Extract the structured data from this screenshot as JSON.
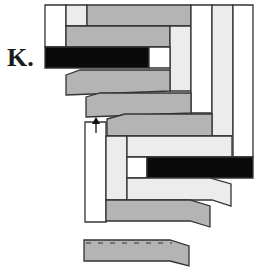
{
  "figure": {
    "label": "K.",
    "colors": {
      "white": "#ffffff",
      "light": "#ececec",
      "gray": "#b4b4b4",
      "black": "#0a0a0a",
      "outline": "#333333"
    },
    "pieces": [
      {
        "id": "top-left-white",
        "fill": "white",
        "points": "45,5 66,5 66,47 45,47"
      },
      {
        "id": "top-small-light",
        "fill": "light",
        "points": "66,5 87,5 87,26 66,26"
      },
      {
        "id": "top-gray-strip",
        "fill": "gray",
        "points": "87,5 191,5 191,26 87,26"
      },
      {
        "id": "second-gray-strip",
        "fill": "gray",
        "points": "66,26 170,26 170,47 66,47"
      },
      {
        "id": "inner-light-vertical",
        "fill": "light",
        "points": "170,26 191,26 191,91 170,91"
      },
      {
        "id": "black-strip-top",
        "fill": "black",
        "points": "45,47 149,47 149,68 45,68"
      },
      {
        "id": "white-square-top",
        "fill": "white",
        "points": "149,47 170,47 170,68 149,68"
      },
      {
        "id": "gray-slanted-1",
        "fill": "gray",
        "points": "66,75 80,70 170,70 170,91 66,95"
      },
      {
        "id": "white-vertical-1",
        "fill": "white",
        "points": "191,5 212,5 212,113 191,113"
      },
      {
        "id": "light-vertical-1",
        "fill": "light",
        "points": "212,5 233,5 233,136 212,136"
      },
      {
        "id": "white-vertical-2",
        "fill": "white",
        "points": "233,5 253,5 253,157 233,157"
      },
      {
        "id": "gray-slanted-2",
        "fill": "gray",
        "points": "86,97 100,93 191,93 191,113 86,117"
      },
      {
        "id": "gray-strip-3",
        "fill": "gray",
        "points": "107,119 125,114 212,114 212,136 107,136"
      },
      {
        "id": "white-vertical-left",
        "fill": "white",
        "points": "85,122 106,122 106,222 85,222"
      },
      {
        "id": "light-vertical-left",
        "fill": "light",
        "points": "106,136 127,136 127,200 106,200"
      },
      {
        "id": "light-strip-mid",
        "fill": "light",
        "points": "127,136 232,136 232,157 127,157"
      },
      {
        "id": "white-square-bottom",
        "fill": "white",
        "points": "127,157 147,157 147,178 127,178"
      },
      {
        "id": "black-strip-bottom",
        "fill": "black",
        "points": "147,157 253,157 253,178 147,178"
      },
      {
        "id": "light-slanted",
        "fill": "light",
        "points": "127,178 210,178 231,184 231,206 212,200 127,200"
      },
      {
        "id": "gray-slanted-bottom",
        "fill": "gray",
        "points": "106,200 190,200 210,206 210,227 190,221 106,221"
      },
      {
        "id": "loose-strip",
        "fill": "gray",
        "points": "84,240 170,240 189,246 189,266 170,261 84,261"
      }
    ],
    "annotations": [
      {
        "id": "arrow-up",
        "type": "arrow",
        "x": 96,
        "y1": 133,
        "y2": 117
      }
    ]
  }
}
